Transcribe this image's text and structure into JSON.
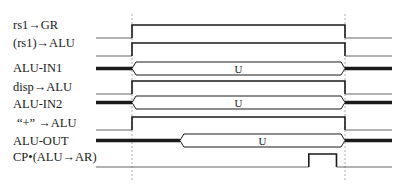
{
  "diagram": {
    "type": "timing-diagram",
    "colors": {
      "line": "#1a1a1a",
      "low_line": "#666666",
      "guide": "#9a9a9a"
    },
    "signals": [
      {
        "name": "rs1-to-gr",
        "label": "rs1→GR",
        "kind": "pulse",
        "high": [
          0,
          1
        ]
      },
      {
        "name": "rs1-contents-to-alu",
        "label": "(rs1)→ALU",
        "kind": "pulse",
        "high": [
          0,
          1
        ]
      },
      {
        "name": "alu-in1",
        "label": "ALU-IN1",
        "kind": "bus",
        "valid": [
          0,
          1
        ],
        "value": "U"
      },
      {
        "name": "disp-to-alu",
        "label": "disp→ALU",
        "kind": "pulse",
        "high": [
          0,
          1
        ]
      },
      {
        "name": "alu-in2",
        "label": "ALU-IN2",
        "kind": "bus",
        "valid": [
          0,
          1
        ],
        "value": "U"
      },
      {
        "name": "plus-to-alu",
        "label": "“+” →ALU",
        "kind": "pulse",
        "high": [
          0,
          1
        ]
      },
      {
        "name": "alu-out",
        "label": "ALU-OUT",
        "kind": "bus",
        "valid": [
          0.225,
          1
        ],
        "value": "U"
      },
      {
        "name": "cp-alu-to-ar",
        "label": "CP•(ALU→AR)",
        "kind": "pulse",
        "high": [
          0.83,
          0.96
        ]
      }
    ]
  }
}
